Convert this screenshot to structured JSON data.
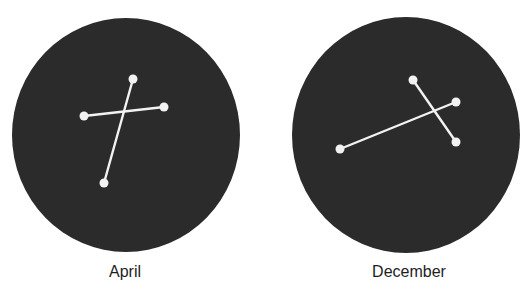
{
  "colors": {
    "background": "#ffffff",
    "disc": "#2b2b2b",
    "constellation": "#f2f2f2",
    "caption": "#1e1e1e"
  },
  "panels": [
    {
      "label": "April",
      "disc": {
        "cx": 126,
        "cy": 135,
        "rx": 114,
        "ry": 117
      },
      "caption_x": 125,
      "stars": [
        {
          "x": 133,
          "y": 79
        },
        {
          "x": 164,
          "y": 107
        },
        {
          "x": 84,
          "y": 116
        },
        {
          "x": 104,
          "y": 183
        }
      ],
      "lines": [
        {
          "from": 0,
          "to": 3
        },
        {
          "from": 2,
          "to": 1
        }
      ]
    },
    {
      "label": "December",
      "disc": {
        "cx": 406,
        "cy": 135,
        "rx": 114,
        "ry": 118
      },
      "caption_x": 409,
      "stars": [
        {
          "x": 413,
          "y": 80
        },
        {
          "x": 456,
          "y": 102
        },
        {
          "x": 456,
          "y": 142
        },
        {
          "x": 340,
          "y": 149
        }
      ],
      "lines": [
        {
          "from": 0,
          "to": 2
        },
        {
          "from": 3,
          "to": 1
        }
      ]
    }
  ]
}
